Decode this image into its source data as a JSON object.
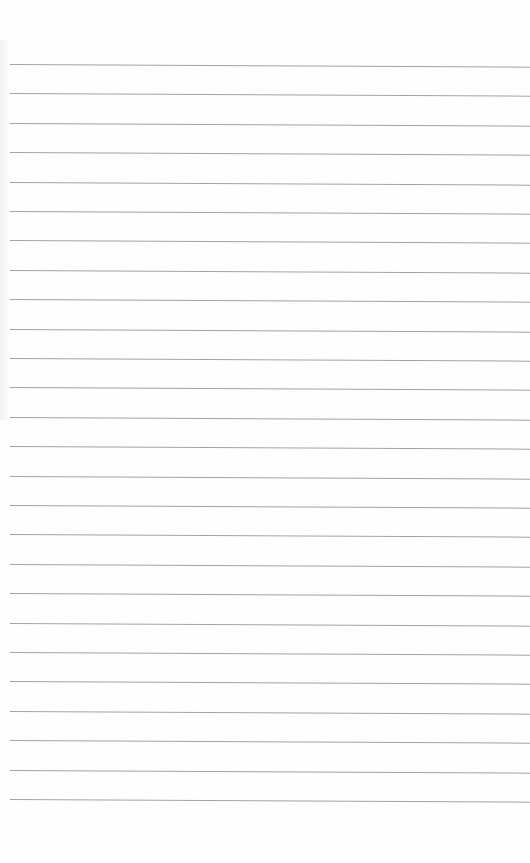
{
  "document": {
    "type": "ruled notebook page",
    "background_color": "#fefefe",
    "rule_color": "#a3a3a3",
    "rule_count": 26,
    "rule_start_y": 65,
    "rule_spacing": 29.4,
    "rule_left_x": 10,
    "visible_text": []
  }
}
